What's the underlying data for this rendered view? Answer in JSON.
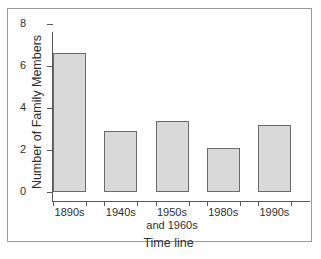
{
  "chart_data": {
    "type": "bar",
    "title": "",
    "xlabel": "Time line",
    "ylabel": "Number of Family Members",
    "categories": [
      "1890s",
      "1940s",
      "1950s and 1960s",
      "1980s",
      "1990s"
    ],
    "category_lines": [
      [
        "1890s"
      ],
      [
        "1940s"
      ],
      [
        "1950s",
        "and 1960s"
      ],
      [
        "1980s"
      ],
      [
        "1990s"
      ]
    ],
    "values": [
      6.6,
      2.9,
      3.4,
      2.1,
      3.2
    ],
    "ylim": [
      0,
      8
    ],
    "yticks": [
      0,
      2,
      4,
      6,
      8
    ],
    "ytick_labels": [
      "0",
      "2",
      "4",
      "6",
      "8"
    ],
    "grid": false,
    "legend": false,
    "bar_fill_color": "#d9d9d9",
    "bar_border_color": "#6a6a6c",
    "axis_color": "#58585a",
    "text_color": "#2e2e30",
    "background_color": "#ffffff",
    "frame_color": "#9a9a9a"
  },
  "caption": ""
}
